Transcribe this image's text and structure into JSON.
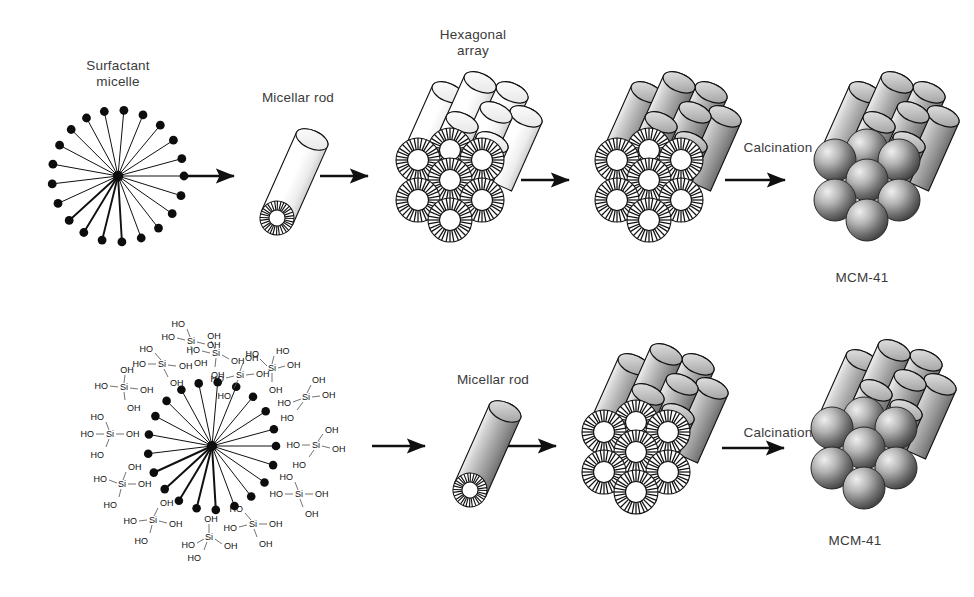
{
  "figure": {
    "width": 974,
    "height": 597,
    "background": "#ffffff",
    "ink": "#1a1a1a",
    "label_color": "#3b3b3b"
  },
  "labels": {
    "surfactant_micelle": "Surfactant\nmicelle",
    "micellar_rod_top": "Micellar rod",
    "hexagonal_array": "Hexagonal\narray",
    "calcination_top": "Calcination",
    "mcm41_top": "MCM-41",
    "micellar_rod_bottom": "Micellar rod",
    "calcination_bottom": "Calcination",
    "mcm41_bottom": "MCM-41"
  },
  "chemistry": {
    "silicate_unit_formula": "Si(OH)4",
    "si_symbol": "Si",
    "hydroxyl_left": "HO",
    "hydroxyl_right": "OH",
    "silicate_count": 14,
    "micelle_tail_count": 26,
    "cylinders_in_bundle": 7
  },
  "stages": {
    "top_row": [
      {
        "id": "surfactant-micelle",
        "label": "Surfactant micelle",
        "kind": "micelle"
      },
      {
        "id": "micellar-rod",
        "label": "Micellar rod",
        "kind": "rod-light"
      },
      {
        "id": "hexagonal-array",
        "label": "Hexagonal array",
        "kind": "bundle-light"
      },
      {
        "id": "silicate-coated-bundle",
        "label": "",
        "kind": "bundle-gray"
      },
      {
        "id": "mcm-41",
        "label": "MCM-41",
        "kind": "bundle-calcined"
      }
    ],
    "bottom_row": [
      {
        "id": "silicate-micelle",
        "label": "",
        "kind": "micelle-silicate"
      },
      {
        "id": "micellar-rod-gray",
        "label": "Micellar rod",
        "kind": "rod-gray"
      },
      {
        "id": "bundle-gray-bottom",
        "label": "",
        "kind": "bundle-gray"
      },
      {
        "id": "mcm-41-bottom",
        "label": "MCM-41",
        "kind": "bundle-calcined"
      }
    ]
  },
  "arrows": {
    "count": 7,
    "direction": "right",
    "transitions": [
      "micelle-to-rod",
      "rod-to-hexagonal-array",
      "array-to-silicate-coated",
      "silicate-coated-to-mcm41",
      "silicate-micelle-to-rod",
      "rod-to-bundle",
      "bundle-to-mcm41"
    ]
  },
  "colors": {
    "outline": "#1a1a1a",
    "cylinder_light_top": "#ffffff",
    "cylinder_light_bottom": "#d8d8d8",
    "cylinder_gray_top": "#f2f2f2",
    "cylinder_gray_mid": "#a9a9a9",
    "cylinder_gray_bottom": "#787878",
    "sphere_light": "#e8e8e8",
    "sphere_dark": "#4a4a4a",
    "label": "#3b3b3b"
  }
}
